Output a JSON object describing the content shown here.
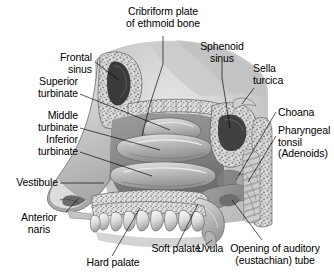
{
  "figure": {
    "view": "sagittal",
    "style": "grayscale medical illustration",
    "background_color": "#ffffff",
    "ink_color": "#000000"
  },
  "labels": {
    "cribriform_plate": "Cribriform plate\nof ethmoid bone",
    "frontal_sinus": "Frontal\nsinus",
    "sphenoid_sinus": "Sphenoid\nsinus",
    "sella_turcica": "Sella\nturcica",
    "superior_turbinate": "Superior\nturbinate",
    "middle_turbinate": "Middle\nturbinate",
    "inferior_turbinate": "Inferior\nturbinate",
    "choana": "Choana",
    "pharyngeal_tonsil": "Pharyngeal\ntonsil\n(Adenoids)",
    "vestibule": "Vestibule",
    "anterior_naris": "Anterior\nnaris",
    "hard_palate": "Hard palate",
    "soft_palate": "Soft palate",
    "uvula": "Uvula",
    "auditory_tube": "Opening of auditory\n(eustachian) tube"
  }
}
